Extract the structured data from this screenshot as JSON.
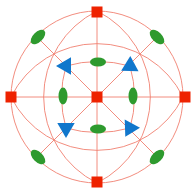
{
  "colors": {
    "background": "#ffffff",
    "lines": "#f08070",
    "fourfold": "#ee2200",
    "threefold": "#1177cc",
    "twofold": "#2e9a2e"
  },
  "projection": {
    "center": [
      97,
      97
    ],
    "radius": 86
  },
  "symmetry_elements": {
    "fourfold_squares": [
      {
        "name": "top",
        "x": 97,
        "y": 12
      },
      {
        "name": "bottom",
        "x": 97,
        "y": 182
      },
      {
        "name": "left",
        "x": 11,
        "y": 97
      },
      {
        "name": "right",
        "x": 185,
        "y": 97
      },
      {
        "name": "center",
        "x": 97,
        "y": 97
      }
    ],
    "threefold_triangles": [
      {
        "name": "upper-left",
        "x": 66,
        "y": 66
      },
      {
        "name": "upper-right",
        "x": 130,
        "y": 66
      },
      {
        "name": "lower-left",
        "x": 66,
        "y": 128
      },
      {
        "name": "lower-right",
        "x": 130,
        "y": 128
      }
    ],
    "twofold_ellipses": [
      {
        "name": "outer-upper-left",
        "x": 38,
        "y": 37,
        "rx": 9,
        "ry": 5,
        "rotate": -45
      },
      {
        "name": "outer-upper-right",
        "x": 157,
        "y": 37,
        "rx": 9,
        "ry": 5,
        "rotate": 45
      },
      {
        "name": "outer-lower-left",
        "x": 38,
        "y": 157,
        "rx": 9,
        "ry": 5,
        "rotate": 45
      },
      {
        "name": "outer-lower-right",
        "x": 157,
        "y": 157,
        "rx": 9,
        "ry": 5,
        "rotate": -45
      },
      {
        "name": "inner-top",
        "x": 98,
        "y": 62,
        "rx": 8,
        "ry": 4.5,
        "rotate": 0
      },
      {
        "name": "inner-bottom",
        "x": 98,
        "y": 129,
        "rx": 8,
        "ry": 4.5,
        "rotate": 0
      },
      {
        "name": "inner-left",
        "x": 63,
        "y": 96,
        "rx": 4.5,
        "ry": 8.5,
        "rotate": 0
      },
      {
        "name": "inner-right",
        "x": 133,
        "y": 96,
        "rx": 4.5,
        "ry": 8.5,
        "rotate": 0
      }
    ]
  }
}
